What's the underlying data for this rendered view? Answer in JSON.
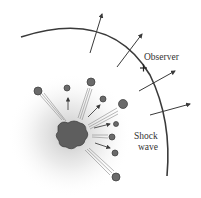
{
  "diagram": {
    "labels": {
      "observer": "Observer",
      "shock_line1": "Shock",
      "shock_line2": "wave"
    },
    "colors": {
      "line": "#3a3a3a",
      "glow": "#cfcfcf",
      "debris": "#6a6a6a"
    }
  }
}
